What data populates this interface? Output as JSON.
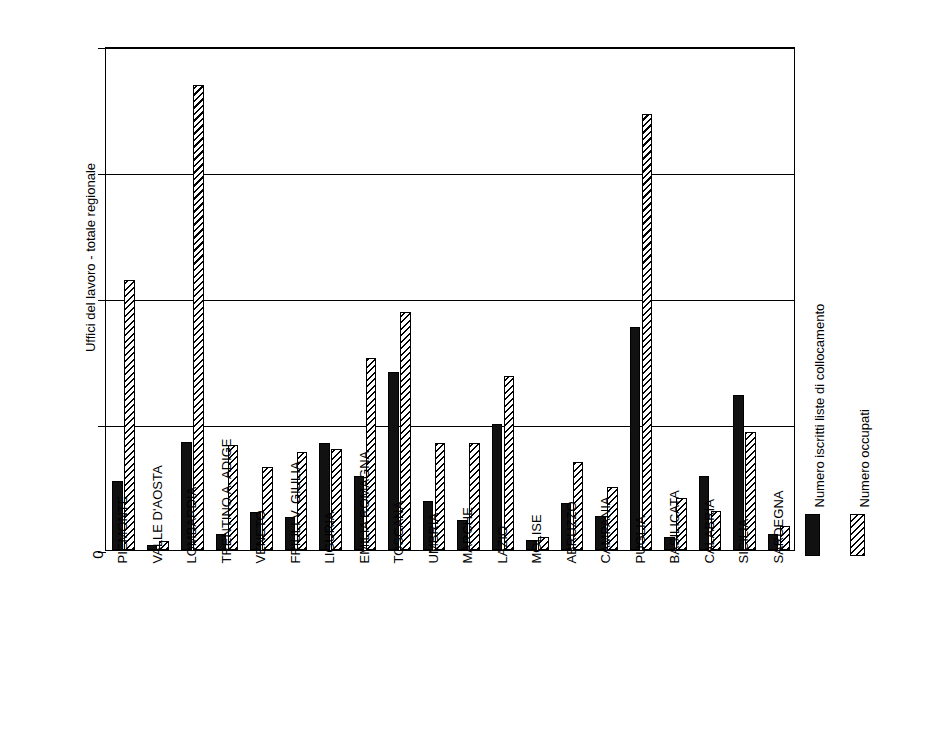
{
  "chart_data": {
    "type": "bar",
    "title": "",
    "xlabel": "",
    "ylabel": "Uffici del lavoro - totale regionale",
    "ylim": [
      0,
      2000
    ],
    "yticks": [
      0,
      500,
      1000,
      1500,
      2000
    ],
    "ytick_labels": [
      "0",
      "500",
      "1000",
      "1500",
      "2000"
    ],
    "grid": true,
    "legend_position": "right",
    "categories": [
      "PIEMONTE",
      "VALLE D'AOSTA",
      "LOMBARDIA",
      "TRENTINO A. ADIGE",
      "VENETO",
      "FRIULI V. GIULIA",
      "LIGURIA",
      "EMILIA ROMAGNA",
      "TOSCANA",
      "UMBRIA",
      "MARCHE",
      "LAZIO",
      "MOLISE",
      "ABRUZZO",
      "CAMPANIA",
      "PUGLIA",
      "BASILICATA",
      "CALABRIA",
      "SICILIA",
      "SARDEGNA"
    ],
    "series": [
      {
        "name": "Numero iscritti liste di collocamento",
        "pattern": "solid",
        "values": [
          275,
          20,
          430,
          65,
          150,
          130,
          425,
          295,
          705,
          195,
          120,
          500,
          40,
          185,
          135,
          885,
          50,
          295,
          615,
          65
        ]
      },
      {
        "name": "Numero occupati",
        "pattern": "hatch",
        "values": [
          1070,
          35,
          1845,
          415,
          330,
          390,
          400,
          760,
          945,
          425,
          425,
          690,
          50,
          350,
          250,
          1730,
          205,
          155,
          470,
          95
        ]
      }
    ]
  },
  "legend": {
    "entries": [
      {
        "label": "Numero iscritti liste di collocamento",
        "pattern": "solid"
      },
      {
        "label": "Numero occupati",
        "pattern": "hatch"
      }
    ]
  },
  "colors": {
    "series_solid": "#111111",
    "series_hatch": "#ffffff",
    "axis": "#000000",
    "background": "#ffffff"
  }
}
